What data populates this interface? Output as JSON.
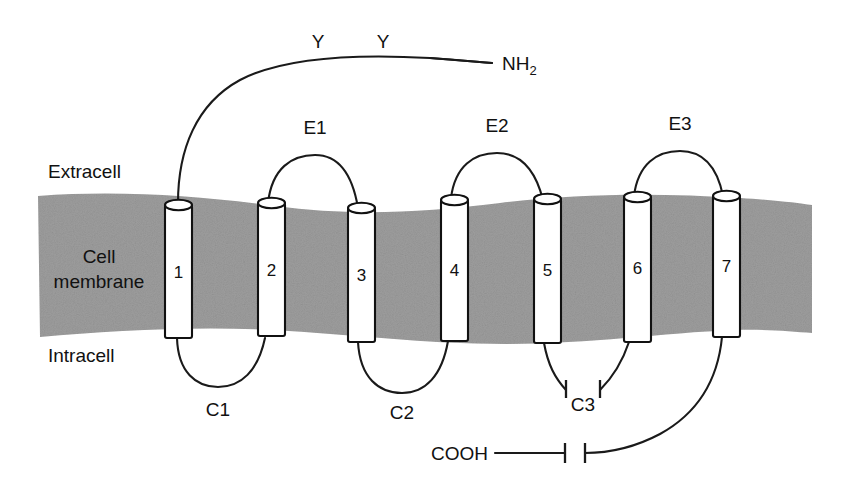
{
  "figure": {
    "background_color": "#ffffff",
    "line_color": "#1a1a1a",
    "membrane_color": "#9a9a9a",
    "helix_fill_color": "#ffffff"
  },
  "regions": {
    "extracellular_label": "Extracell",
    "membrane_label_line1": "Cell",
    "membrane_label_line2": "membrane",
    "intracellular_label": "Intracell"
  },
  "termini": {
    "n_terminus": "NH",
    "n_terminus_subscript": "2",
    "c_terminus": "COOH"
  },
  "glycosylation": {
    "symbol": "Y",
    "sites": [
      "Y",
      "Y"
    ],
    "count": 2
  },
  "helices": [
    {
      "number": "1",
      "x": 165,
      "label": "1"
    },
    {
      "number": "2",
      "x": 258,
      "label": "2"
    },
    {
      "number": "3",
      "x": 348,
      "label": "3"
    },
    {
      "number": "4",
      "x": 441,
      "label": "4"
    },
    {
      "number": "5",
      "x": 534,
      "label": "5"
    },
    {
      "number": "6",
      "x": 624,
      "label": "6"
    },
    {
      "number": "7",
      "x": 713,
      "label": "7"
    }
  ],
  "extracellular_loops": [
    {
      "id": "E1",
      "label": "E1",
      "between": [
        "2",
        "3"
      ]
    },
    {
      "id": "E2",
      "label": "E2",
      "between": [
        "4",
        "5"
      ]
    },
    {
      "id": "E3",
      "label": "E3",
      "between": [
        "6",
        "7"
      ]
    }
  ],
  "intracellular_loops": [
    {
      "id": "C1",
      "label": "C1",
      "between": [
        "1",
        "2"
      ]
    },
    {
      "id": "C2",
      "label": "C2",
      "between": [
        "3",
        "4"
      ]
    },
    {
      "id": "C3",
      "label": "C3",
      "between": [
        "5",
        "6"
      ],
      "truncated": true
    }
  ],
  "truncation_marks": {
    "c3_break": true,
    "cooh_break": true
  }
}
